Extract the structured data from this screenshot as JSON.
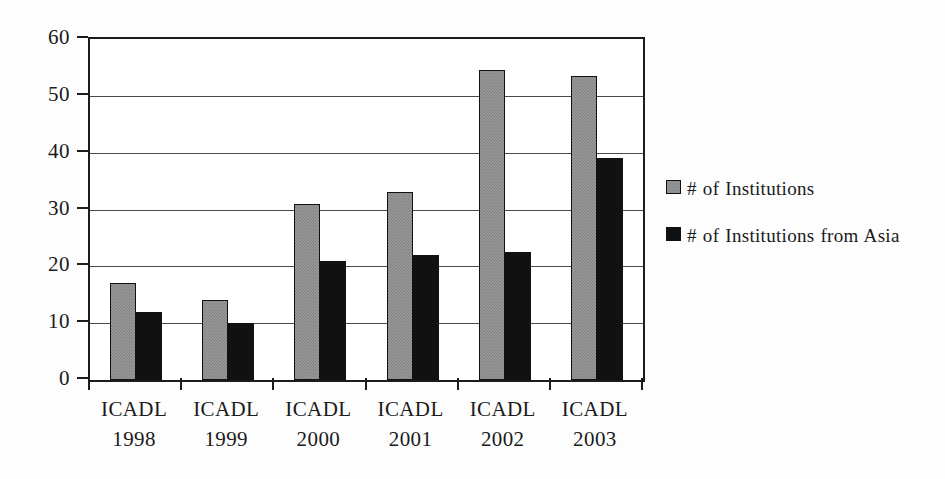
{
  "chart_data": {
    "type": "bar",
    "title": "",
    "xlabel": "",
    "ylabel": "",
    "ylim": [
      0,
      60
    ],
    "y_ticks": [
      0,
      10,
      20,
      30,
      40,
      50,
      60
    ],
    "grid": true,
    "legend_position": "right",
    "categories": [
      "ICADL 1998",
      "ICADL 1999",
      "ICADL 2000",
      "ICADL 2001",
      "ICADL 2002",
      "ICADL 2003"
    ],
    "category_lines": [
      {
        "line1": "ICADL",
        "line2": "1998"
      },
      {
        "line1": "ICADL",
        "line2": "1999"
      },
      {
        "line1": "ICADL",
        "line2": "2000"
      },
      {
        "line1": "ICADL",
        "line2": "2001"
      },
      {
        "line1": "ICADL",
        "line2": "2002"
      },
      {
        "line1": "ICADL",
        "line2": "2003"
      }
    ],
    "series": [
      {
        "name": "# of Institutions",
        "color": "#9b9b9b",
        "values": [
          17,
          14,
          31,
          33,
          54.5,
          53.5
        ]
      },
      {
        "name": "# of Institutions from Asia",
        "color": "#111111",
        "values": [
          12,
          10,
          21,
          22,
          22.5,
          39
        ]
      }
    ]
  },
  "legend": {
    "items": [
      {
        "label": "# of Institutions",
        "swatch": "gray-square-swatch"
      },
      {
        "label": "# of Institutions from Asia",
        "swatch": "black-square-swatch"
      }
    ]
  },
  "axis": {
    "y_tick_labels": [
      "60",
      "50",
      "40",
      "30",
      "20",
      "10",
      "0"
    ]
  }
}
